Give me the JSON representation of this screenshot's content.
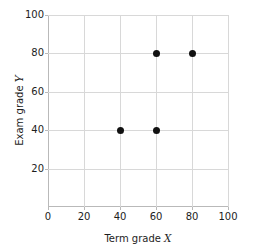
{
  "chart_data": {
    "type": "scatter",
    "title": "",
    "xlabel": "Term grade X",
    "xlabel_text": "Term grade",
    "xlabel_var": "X",
    "ylabel": "Exam grade Y",
    "ylabel_text": "Exam grade",
    "ylabel_var": "Y",
    "xlim": [
      0,
      100
    ],
    "ylim": [
      0,
      100
    ],
    "xticks": [
      0,
      20,
      40,
      60,
      80,
      100
    ],
    "yticks": [
      20,
      40,
      60,
      80,
      100
    ],
    "xtick_labels": [
      "0",
      "20",
      "40",
      "60",
      "80",
      "100"
    ],
    "ytick_labels": [
      "20",
      "40",
      "60",
      "80",
      "100"
    ],
    "grid": true,
    "legend": "none",
    "marker": "filled-circle",
    "marker_color": "#111111",
    "grid_color": "#d8d8d8",
    "axis_color": "#b9b9b9",
    "background": "#ffffff",
    "points": [
      {
        "x": 40,
        "y": 40
      },
      {
        "x": 60,
        "y": 40
      },
      {
        "x": 60,
        "y": 80
      },
      {
        "x": 80,
        "y": 80
      }
    ]
  }
}
